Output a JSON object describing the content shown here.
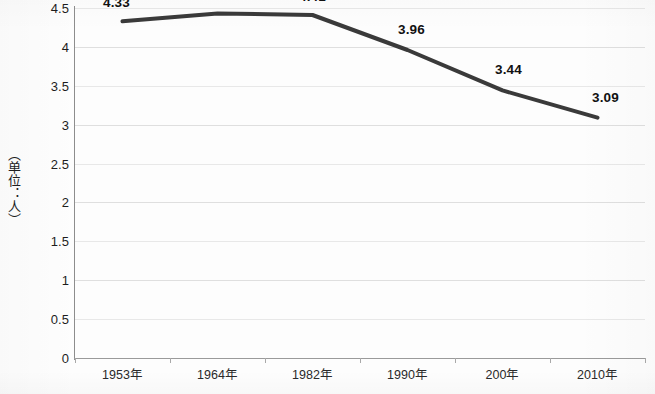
{
  "chart_data": {
    "type": "line",
    "title": "",
    "subtitle": "",
    "xlabel": "",
    "ylabel": "（单位：人）",
    "categories": [
      "1953年",
      "1964年",
      "1982年",
      "1990年",
      "200年",
      "2010年"
    ],
    "values": [
      4.33,
      4.43,
      4.41,
      3.96,
      3.44,
      3.09
    ],
    "series": [
      {
        "name": "",
        "values": [
          4.33,
          4.43,
          4.41,
          3.96,
          3.44,
          3.09
        ]
      }
    ],
    "data_labels": [
      "4.33",
      "4.43",
      "4.41",
      "3.96",
      "3.44",
      "3.09"
    ],
    "ylim": [
      0,
      4.5
    ],
    "ytick_labels": [
      "0",
      "0.5",
      "1",
      "1.5",
      "2",
      "2.5",
      "3",
      "3.5",
      "4",
      "4.5"
    ],
    "ytick_values": [
      0,
      0.5,
      1,
      1.5,
      2,
      2.5,
      3,
      3.5,
      4,
      4.5
    ],
    "grid": "horizontal",
    "legend": "none",
    "line_color": "#3a3a3a",
    "line_width": 4,
    "markers": "none",
    "background_color": "#fdfdfd",
    "gridline_color": "#c8c8c8",
    "axis_color": "#8d8d8d",
    "text_color": "#1d1d1d"
  }
}
